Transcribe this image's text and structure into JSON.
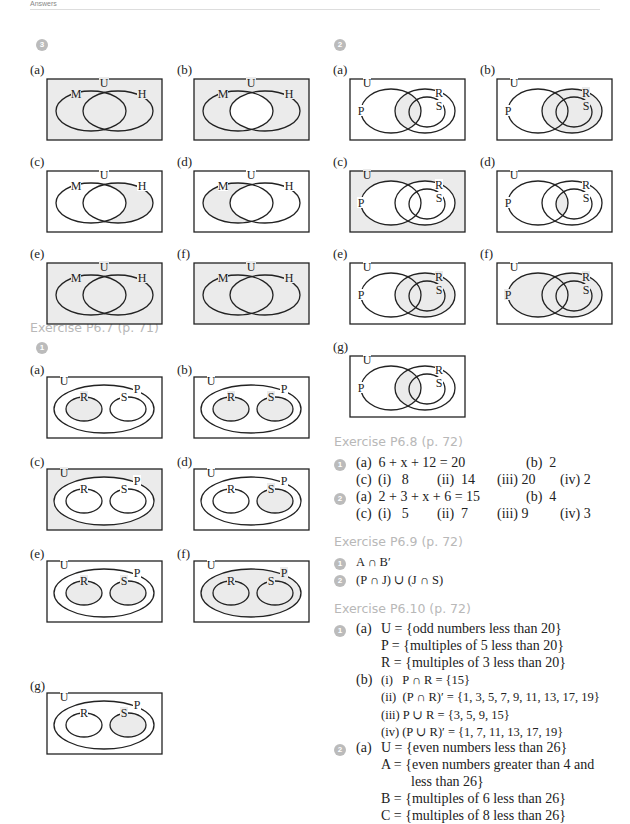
{
  "header": {
    "text": "Answers"
  },
  "left": {
    "question_badge_top": "3",
    "mh_diagrams": [
      {
        "label": "(a)",
        "shading": "everything",
        "sets": [
          "U",
          "M",
          "H"
        ]
      },
      {
        "label": "(b)",
        "shading": "all-except-intersection",
        "sets": [
          "U",
          "M",
          "H"
        ]
      },
      {
        "label": "(c)",
        "shading": "H-only",
        "sets": [
          "U",
          "M",
          "H"
        ]
      },
      {
        "label": "(d)",
        "shading": "M-only",
        "sets": [
          "U",
          "M",
          "H"
        ]
      },
      {
        "label": "(e)",
        "shading": "everything",
        "sets": [
          "U",
          "M",
          "H"
        ]
      },
      {
        "label": "(f)",
        "shading": "everything",
        "sets": [
          "U",
          "M",
          "H"
        ]
      }
    ],
    "exercise_p67": {
      "title": "Exercise P6.7 (p. 71)",
      "question_badge": "1",
      "diagrams": [
        {
          "label": "(a)",
          "shading": "R",
          "sets": [
            "U",
            "P",
            "R",
            "S"
          ]
        },
        {
          "label": "(b)",
          "shading": "R and S",
          "sets": [
            "U",
            "P",
            "R",
            "S"
          ]
        },
        {
          "label": "(c)",
          "shading": "outside P",
          "sets": [
            "U",
            "P",
            "R",
            "S"
          ]
        },
        {
          "label": "(d)",
          "shading": "S",
          "sets": [
            "U",
            "P",
            "R",
            "S"
          ]
        },
        {
          "label": "(e)",
          "shading": "R and S",
          "sets": [
            "U",
            "P",
            "R",
            "S"
          ]
        },
        {
          "label": "(f)",
          "shading": "P",
          "sets": [
            "U",
            "P",
            "R",
            "S"
          ]
        },
        {
          "label": "(g)",
          "shading": "S",
          "sets": [
            "U",
            "P",
            "R",
            "S"
          ]
        }
      ]
    }
  },
  "right": {
    "question_badge_top": "2",
    "prs_diagrams": [
      {
        "label": "(a)",
        "shading": "P∩R",
        "sets": [
          "U",
          "P",
          "R",
          "S"
        ]
      },
      {
        "label": "(b)",
        "shading": "R",
        "sets": [
          "U",
          "P",
          "R",
          "S"
        ]
      },
      {
        "label": "(c)",
        "shading": "outside P∪R",
        "sets": [
          "U",
          "P",
          "R",
          "S"
        ]
      },
      {
        "label": "(d)",
        "shading": "P∩S",
        "sets": [
          "U",
          "P",
          "R",
          "S"
        ]
      },
      {
        "label": "(e)",
        "shading": "R",
        "sets": [
          "U",
          "P",
          "R",
          "S"
        ]
      },
      {
        "label": "(f)",
        "shading": "P∪R",
        "sets": [
          "U",
          "P",
          "R",
          "S"
        ]
      },
      {
        "label": "(g)",
        "shading": "P∩R",
        "sets": [
          "U",
          "P",
          "R",
          "S"
        ]
      }
    ],
    "exercise_p68": {
      "title": "Exercise P6.8 (p. 72)",
      "q1": {
        "badge": "1",
        "a": "(a)  6 + x + 12 = 20",
        "b": "(b)  2",
        "c": "(c)",
        "ci": "(i)   8",
        "cii": "(ii)  14",
        "ciii": "(iii) 20",
        "civ": "(iv) 2"
      },
      "q2": {
        "badge": "2",
        "a": "(a)  2 + 3 + x + 6 = 15",
        "b": "(b)  4",
        "c": "(c)",
        "ci": "(i)   5",
        "cii": "(ii)  7",
        "ciii": "(iii) 9",
        "civ": "(iv) 3"
      }
    },
    "exercise_p69": {
      "title": "Exercise P6.9 (p. 72)",
      "q1": {
        "badge": "1",
        "text": "A ∩ B′"
      },
      "q2": {
        "badge": "2",
        "text": "(P ∩ J) ∪ (J ∩ S)"
      }
    },
    "exercise_p610": {
      "title": "Exercise P6.10 (p. 72)",
      "q1": {
        "badge": "1",
        "a_label": "(a)",
        "a_lines": [
          "U = {odd numbers less than 20}",
          "P = {multiples of 5 less than 20}",
          "R = {multiples of 3 less than 20}"
        ],
        "b_label": "(b)",
        "b_lines": [
          "(i)   P ∩ R = {15}",
          "(ii)  (P ∩ R)′ = {1, 3, 5, 7, 9, 11, 13, 17, 19}",
          "(iii) P ∪ R = {3, 5, 9, 15}",
          "(iv) (P ∪ R)′ = {1, 7, 11, 13, 17, 19}"
        ]
      },
      "q2": {
        "badge": "2",
        "a_label": "(a)",
        "a_lines": [
          "U = {even numbers less than 26}",
          "A = {even numbers greater than 4 and",
          "less than 26}",
          "B = {multiples of 6 less than 26}",
          "C = {multiples of 8 less than 26}"
        ]
      }
    }
  },
  "colors": {
    "shade": "#ebebeb",
    "line": "#222222",
    "heading": "#b8b8b8",
    "badge": "#bbbbbb"
  }
}
